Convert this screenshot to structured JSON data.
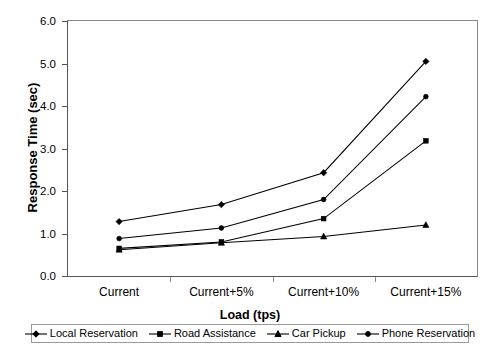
{
  "chart_data": {
    "type": "line",
    "title": "",
    "xlabel": "Load (tps)",
    "ylabel": "Response Time (sec)",
    "categories": [
      "Current",
      "Current+5%",
      "Current+10%",
      "Current+15%"
    ],
    "ylim": [
      0.0,
      6.0
    ],
    "yticks": [
      "6.0",
      "5.0",
      "4.0",
      "3.0",
      "2.0",
      "1.0",
      "0.0"
    ],
    "ytick_values": [
      6.0,
      5.0,
      4.0,
      3.0,
      2.0,
      1.0,
      0.0
    ],
    "grid": false,
    "legend_position": "bottom",
    "series": [
      {
        "name": "Local Reservation",
        "marker": "diamond",
        "color": "#000000",
        "values": [
          1.28,
          1.68,
          2.43,
          5.05
        ]
      },
      {
        "name": "Road Assistance",
        "marker": "square",
        "color": "#000000",
        "values": [
          0.65,
          0.8,
          1.35,
          3.18
        ]
      },
      {
        "name": "Car Pickup",
        "marker": "triangle",
        "color": "#000000",
        "values": [
          0.62,
          0.78,
          0.93,
          1.2
        ]
      },
      {
        "name": "Phone Reservation",
        "marker": "circle",
        "color": "#000000",
        "values": [
          0.88,
          1.13,
          1.8,
          4.22
        ]
      }
    ]
  }
}
